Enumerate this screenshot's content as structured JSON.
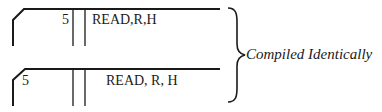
{
  "cards": [
    {
      "label_field": "5",
      "statement_field": "READ,R,H",
      "description": "Label right-aligned in label field, statement compact"
    },
    {
      "label_field": "5",
      "statement_field": "READ, R, H",
      "description": "Label left-aligned in label field, statement with spaces"
    }
  ],
  "brace_caption": "Compiled Identically",
  "colors": {
    "ink": "#1a1a1a",
    "background": "#ffffff"
  }
}
